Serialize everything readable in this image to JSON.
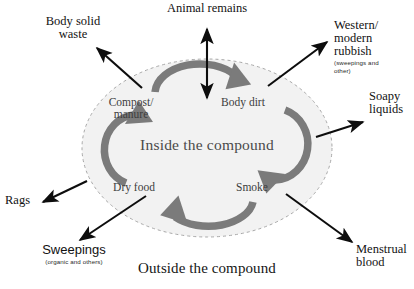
{
  "figure": {
    "inside_label": "Inside the compound",
    "outside_label": "Outside the compound"
  },
  "inner_nodes": [
    {
      "id": "compost-manure",
      "line1": "Compost/",
      "line2": "manure"
    },
    {
      "id": "body-dirt",
      "line1": "Body dirt",
      "line2": ""
    },
    {
      "id": "smoke",
      "line1": "Smoke",
      "line2": ""
    },
    {
      "id": "dry-food",
      "line1": "Dry food",
      "line2": ""
    }
  ],
  "external_nodes": [
    {
      "id": "animal-remains",
      "line1": "Animal remains",
      "line2": "",
      "line3": "",
      "sub": ""
    },
    {
      "id": "body-solid-waste",
      "line1": "Body solid",
      "line2": "waste",
      "line3": "",
      "sub": ""
    },
    {
      "id": "western-modern-rubbish",
      "line1": "Western/",
      "line2": "modern",
      "line3": "rubbish",
      "sub": "(sweepings and other)"
    },
    {
      "id": "soapy-liquids",
      "line1": "Soapy",
      "line2": "liquids",
      "line3": "",
      "sub": ""
    },
    {
      "id": "menstrual-blood",
      "line1": "Menstrual",
      "line2": "blood",
      "line3": "",
      "sub": ""
    },
    {
      "id": "sweepings",
      "line1": "Sweepings",
      "line2": "",
      "line3": "",
      "sub": "(organic and others)"
    },
    {
      "id": "rags",
      "line1": "Rags",
      "line2": "",
      "line3": "",
      "sub": ""
    }
  ],
  "colors": {
    "cycle_arrow": "#7b7b7b",
    "flow_arrow": "#0d0d0d",
    "ellipse_fill": "#f2f2f2",
    "ellipse_stroke": "#a8a8a8",
    "inner_text": "#3d3d3d",
    "inside_title": "#4a4a4a"
  },
  "cycle": {
    "direction": "clockwise",
    "sequence": [
      "Compost/manure",
      "Body dirt",
      "Smoke",
      "Dry food"
    ]
  }
}
